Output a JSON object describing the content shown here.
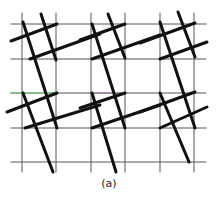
{
  "figure": {
    "caption": "(a)",
    "colors": {
      "background": "#ffffff",
      "grid": "#555555",
      "thick": "#111111",
      "artifact_green": "#6fd36f",
      "artifact_purple": "#9a6fa0"
    },
    "grid": {
      "vertical_x": [
        22,
        56,
        91,
        125,
        160,
        194
      ],
      "vertical_y_range": [
        13,
        172
      ],
      "horizontal_y": [
        24,
        59,
        93,
        128,
        162
      ],
      "horizontal_x_range": [
        11,
        206
      ]
    },
    "steep_lines": [
      [
        23,
        22,
        57,
        128
      ],
      [
        41,
        14,
        56,
        60
      ],
      [
        23,
        93,
        53,
        172
      ],
      [
        92,
        24,
        125,
        128
      ],
      [
        108,
        14,
        125,
        58
      ],
      [
        92,
        93,
        116,
        172
      ],
      [
        160,
        22,
        195,
        128
      ],
      [
        178,
        12,
        195,
        57
      ],
      [
        160,
        93,
        189,
        162
      ]
    ],
    "shallow_lines": [
      [
        11,
        41,
        57,
        24
      ],
      [
        30,
        59,
        100,
        34
      ],
      [
        7,
        112,
        57,
        93
      ],
      [
        25,
        128,
        100,
        105
      ],
      [
        80,
        40,
        125,
        24
      ],
      [
        92,
        59,
        160,
        35
      ],
      [
        80,
        108,
        125,
        93
      ],
      [
        92,
        128,
        160,
        105
      ],
      [
        140,
        43,
        195,
        23
      ],
      [
        160,
        59,
        207,
        42
      ],
      [
        140,
        112,
        195,
        92
      ],
      [
        160,
        128,
        207,
        107
      ]
    ],
    "artifacts": [
      {
        "color": "artifact_green",
        "x1": 10,
        "y1": 93,
        "x2": 55,
        "y2": 93
      },
      {
        "color": "artifact_purple",
        "x1": 95,
        "y1": 93,
        "x2": 120,
        "y2": 93
      }
    ]
  }
}
